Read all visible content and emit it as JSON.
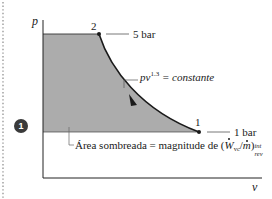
{
  "diagram": {
    "type": "p-v diagram",
    "axes": {
      "y_label": "p",
      "x_label": "v"
    },
    "states": [
      {
        "id": "2",
        "label": "2",
        "pressure_label": "5 bar"
      },
      {
        "id": "1",
        "label": "1",
        "pressure_label": "1 bar"
      }
    ],
    "process_curve": {
      "label_base": "pv",
      "label_exponent": "1.3",
      "label_rest": " = constante",
      "direction": "from 1 to 2 (arrow on curve)"
    },
    "shaded_area": {
      "text_prefix": "Área sombreada = magnitude de (",
      "w_symbol": "W",
      "w_sub": "vc",
      "slash": "/",
      "m_symbol": "m",
      "text_suffix": ")",
      "sub_top": "int",
      "sub_bottom": "rev"
    },
    "badge": {
      "number": "1"
    },
    "colors": {
      "shade": "#a9a9a9",
      "line": "#1a1a1a",
      "leader": "#555555",
      "badge": "#3a3a3a"
    }
  }
}
